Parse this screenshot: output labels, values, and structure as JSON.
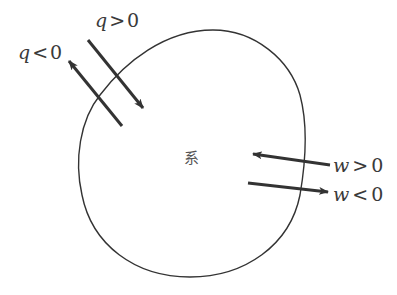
{
  "diagram": {
    "system_label": "系",
    "colors": {
      "outline": "#333333",
      "arrow": "#333333",
      "text": "#3a3a3a",
      "background": "#ffffff"
    },
    "arrows": [
      {
        "id": "q-positive",
        "var": "q",
        "op": ">",
        "value": "0",
        "direction": "into-system"
      },
      {
        "id": "q-negative",
        "var": "q",
        "op": "<",
        "value": "0",
        "direction": "out-of-system"
      },
      {
        "id": "w-positive",
        "var": "w",
        "op": ">",
        "value": "0",
        "direction": "into-system"
      },
      {
        "id": "w-negative",
        "var": "w",
        "op": "<",
        "value": "0",
        "direction": "out-of-system"
      }
    ]
  }
}
